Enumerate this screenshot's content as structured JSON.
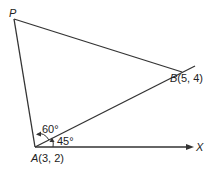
{
  "diagram": {
    "points": {
      "P": {
        "label": "P"
      },
      "A": {
        "label": "A",
        "coords": "(3, 2)"
      },
      "B": {
        "label": "B",
        "coords": "(5, 4)"
      },
      "X": {
        "label": "X"
      }
    },
    "angles": {
      "PAB": "60°",
      "BAX": "45°"
    },
    "colors": {
      "line": "#333333",
      "text": "#222222"
    }
  }
}
